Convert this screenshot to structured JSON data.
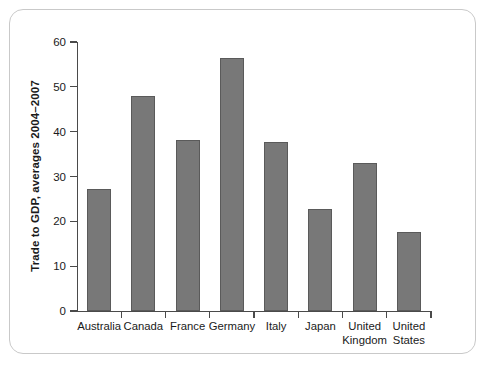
{
  "chart_data": {
    "type": "bar",
    "title": "",
    "subtitle": "",
    "xlabel": "",
    "ylabel": "Trade to GDP, averages 2004–2007",
    "ylim": [
      0,
      60
    ],
    "yticks": [
      0,
      10,
      20,
      30,
      40,
      50,
      60
    ],
    "ytick_labels": [
      "0",
      "10",
      "20",
      "30",
      "40",
      "50",
      "60"
    ],
    "grid": false,
    "legend": false,
    "legend_position": "none",
    "bar_color": "#787878",
    "bar_edge_color": "#5a5a5a",
    "axis_color": "#4a4a4a",
    "frame_color": "#c9c9c9",
    "background": "#ffffff",
    "categories": [
      "Australia",
      "Canada",
      "France",
      "Germany",
      "Italy",
      "Japan",
      "United Kingdom",
      "United States"
    ],
    "category_lines": [
      [
        "Australia"
      ],
      [
        "Canada"
      ],
      [
        "France"
      ],
      [
        "Germany"
      ],
      [
        "Italy"
      ],
      [
        "Japan"
      ],
      [
        "United",
        "Kingdom"
      ],
      [
        "United",
        "States"
      ]
    ],
    "values": [
      27.2,
      48.0,
      38.1,
      56.5,
      37.7,
      22.8,
      33.0,
      17.6
    ],
    "series": [
      {
        "name": "Trade to GDP",
        "values": [
          27.2,
          48.0,
          38.1,
          56.5,
          37.7,
          22.8,
          33.0,
          17.6
        ]
      }
    ]
  }
}
